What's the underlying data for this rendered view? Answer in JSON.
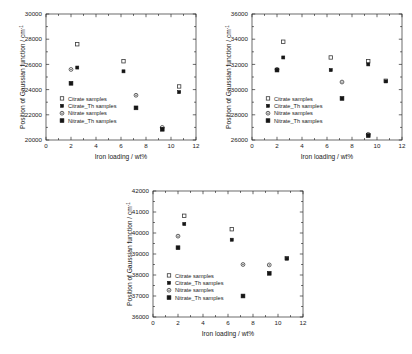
{
  "figure": {
    "background": "#ffffff",
    "panel_count": 3
  },
  "common": {
    "xlabel": "Iron loading / wt%",
    "ylabel": "Position of Gaussian function / cm",
    "ylabel_sup": "-1",
    "xlim": [
      0,
      12
    ],
    "xticks": [
      0,
      2,
      4,
      6,
      8,
      10,
      12
    ],
    "legend": [
      {
        "label": "Citrate samples",
        "marker": "open-square"
      },
      {
        "label": "Citrate_Th samples",
        "marker": "filled-square-small"
      },
      {
        "label": "Nitrate samples",
        "marker": "open-circle-dot"
      },
      {
        "label": "Nitrate_Th samples",
        "marker": "filled-square"
      }
    ]
  },
  "chart_data": [
    {
      "id": "panel-top-left",
      "type": "scatter",
      "title": "",
      "xlabel": "Iron loading / wt%",
      "ylabel": "Position of Gaussian function / cm-1",
      "xlim": [
        0,
        12
      ],
      "ylim": [
        20000,
        30000
      ],
      "xticks": [
        0,
        2,
        4,
        6,
        8,
        10,
        12
      ],
      "yticks": [
        20000,
        22000,
        24000,
        26000,
        28000,
        30000
      ],
      "grid": false,
      "legend_position": "lower-left",
      "series": [
        {
          "name": "Citrate samples",
          "marker": "open-square",
          "points": [
            [
              2.5,
              27600
            ],
            [
              6.2,
              26250
            ],
            [
              10.65,
              24250
            ]
          ]
        },
        {
          "name": "Citrate_Th samples",
          "marker": "filled-square-small",
          "points": [
            [
              2.5,
              25750
            ],
            [
              6.2,
              25450
            ],
            [
              10.65,
              23800
            ]
          ]
        },
        {
          "name": "Nitrate samples",
          "marker": "open-circle-dot",
          "points": [
            [
              2.0,
              25600
            ],
            [
              7.2,
              23550
            ],
            [
              9.3,
              21000
            ]
          ]
        },
        {
          "name": "Nitrate_Th samples",
          "marker": "filled-square",
          "points": [
            [
              2.0,
              24500
            ],
            [
              7.2,
              22550
            ],
            [
              9.3,
              20850
            ]
          ]
        }
      ]
    },
    {
      "id": "panel-top-right",
      "type": "scatter",
      "title": "",
      "xlabel": "Iron loading / wt%",
      "ylabel": "Position of Gaussian function / cm-1",
      "xlim": [
        0,
        12
      ],
      "ylim": [
        26000,
        36000
      ],
      "xticks": [
        0,
        2,
        4,
        6,
        8,
        10,
        12
      ],
      "yticks": [
        26000,
        28000,
        30000,
        32000,
        34000,
        36000
      ],
      "grid": false,
      "legend_position": "lower-left",
      "series": [
        {
          "name": "Citrate samples",
          "marker": "open-square",
          "points": [
            [
              2.5,
              33800
            ],
            [
              6.3,
              32550
            ],
            [
              9.3,
              32250
            ],
            [
              10.7,
              30700
            ]
          ]
        },
        {
          "name": "Citrate_Th samples",
          "marker": "filled-square-small",
          "points": [
            [
              2.5,
              32550
            ],
            [
              6.3,
              31550
            ],
            [
              9.3,
              32000
            ],
            [
              10.7,
              30650
            ]
          ]
        },
        {
          "name": "Nitrate samples",
          "marker": "open-circle-dot",
          "points": [
            [
              2.0,
              31600
            ],
            [
              7.2,
              30600
            ],
            [
              9.3,
              26450
            ]
          ]
        },
        {
          "name": "Nitrate_Th samples",
          "marker": "filled-square",
          "points": [
            [
              2.0,
              31550
            ],
            [
              7.2,
              29300
            ],
            [
              9.3,
              26350
            ]
          ]
        }
      ]
    },
    {
      "id": "panel-bottom",
      "type": "scatter",
      "title": "",
      "xlabel": "Iron loading / wt%",
      "ylabel": "Position of Gaussian function / cm-1",
      "xlim": [
        0,
        12
      ],
      "ylim": [
        36000,
        42000
      ],
      "xticks": [
        0,
        2,
        4,
        6,
        8,
        10,
        12
      ],
      "yticks": [
        36000,
        37000,
        38000,
        39000,
        40000,
        41000,
        42000
      ],
      "grid": false,
      "legend_position": "lower-left",
      "series": [
        {
          "name": "Citrate samples",
          "marker": "open-square",
          "points": [
            [
              2.5,
              40820
            ],
            [
              6.3,
              40180
            ],
            [
              10.7,
              38800
            ]
          ]
        },
        {
          "name": "Citrate_Th samples",
          "marker": "filled-square-small",
          "points": [
            [
              2.5,
              40430
            ],
            [
              6.3,
              39680
            ],
            [
              10.7,
              38780
            ]
          ]
        },
        {
          "name": "Nitrate samples",
          "marker": "open-circle-dot",
          "points": [
            [
              2.0,
              39850
            ],
            [
              7.2,
              38500
            ],
            [
              9.3,
              38480
            ]
          ]
        },
        {
          "name": "Nitrate_Th samples",
          "marker": "filled-square",
          "points": [
            [
              2.0,
              39300
            ],
            [
              7.2,
              37000
            ],
            [
              9.3,
              38080
            ]
          ]
        }
      ]
    }
  ]
}
